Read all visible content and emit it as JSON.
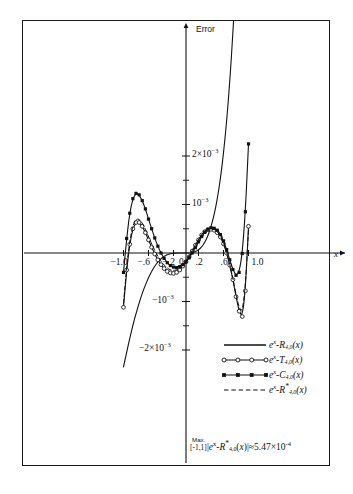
{
  "figure": {
    "axis_label_y": "Error",
    "axis_label_x": "x",
    "caption": ""
  },
  "chart_data": {
    "type": "line",
    "title": "",
    "xlabel": "x",
    "ylabel": "Error",
    "xlim": [
      -1.12,
      1.2
    ],
    "ylim": [
      -0.00235,
      0.00255
    ],
    "grid": false,
    "legend_position": "bottom-right",
    "xticks": [
      -1.0,
      -0.6,
      -0.2,
      0,
      0.2,
      0.6,
      1.0
    ],
    "xtick_labels": [
      "-1.0",
      "-.6",
      "-.2",
      "0",
      ".2",
      ".6",
      "1.0"
    ],
    "yticks": [
      -0.002,
      -0.001,
      0.001,
      0.002
    ],
    "ytick_labels": [
      "-2×10⁻³",
      "-10⁻³",
      "10⁻³",
      "2×10⁻³"
    ],
    "yminor_ticks": [
      -0.0015,
      -0.0005,
      0.0005,
      0.0015
    ],
    "annotation": {
      "prefix": "Max.",
      "interval": "[-1,1]",
      "expression": "|e",
      "full": "Max. [-1,1] |eˣ−R*₄,₀(x)| ≈ 5.47×10⁻⁴",
      "value": "5.47×10⁻⁴"
    },
    "series": [
      {
        "name": "e^x - R_{4,0}(x)",
        "label_base": "e",
        "label_sup": "x",
        "label_rest": "-R",
        "label_sub": "4,0",
        "label_tail": "(x)",
        "style": "solid",
        "marker": "none",
        "color": "#111111",
        "x": [
          -1.0,
          -0.95,
          -0.9,
          -0.85,
          -0.8,
          -0.75,
          -0.7,
          -0.65,
          -0.6,
          -0.55,
          -0.5,
          -0.45,
          -0.4,
          -0.35,
          -0.3,
          -0.25,
          -0.2,
          -0.15,
          -0.1,
          -0.05,
          0,
          0.05,
          0.1,
          0.15,
          0.2,
          0.25,
          0.3,
          0.35,
          0.4,
          0.45,
          0.5,
          0.55,
          0.6,
          0.65,
          0.7,
          0.75,
          0.8,
          0.85
        ],
        "y": [
          -0.00235,
          -0.00205,
          -0.00176,
          -0.00149,
          -0.00125,
          -0.00103,
          -0.00083,
          -0.00066,
          -0.00051,
          -0.00038,
          -0.00027,
          -0.000185,
          -0.000118,
          -6.95e-05,
          -3.65e-05,
          -1.55e-05,
          -4.8e-06,
          -8e-07,
          0,
          2e-07,
          0,
          1.2e-06,
          8.2e-06,
          2.65e-05,
          6.25e-05,
          0.000123,
          0.000216,
          0.00035,
          0.000536,
          0.000785,
          0.00111,
          0.00152,
          0.00205,
          0.00271,
          0.00352,
          0.00452,
          0.00572,
          0.00718
        ]
      },
      {
        "name": "e^x - T_{4,0}(x)",
        "label_base": "e",
        "label_sup": "x",
        "label_rest": "-T",
        "label_sub": "4,0",
        "label_tail": "(x)",
        "style": "solid",
        "marker": "open-circle",
        "color": "#111111",
        "x": [
          -1.0,
          -0.95,
          -0.9,
          -0.85,
          -0.8,
          -0.75,
          -0.7,
          -0.65,
          -0.6,
          -0.55,
          -0.5,
          -0.45,
          -0.4,
          -0.35,
          -0.3,
          -0.25,
          -0.2,
          -0.15,
          -0.1,
          -0.05,
          0,
          0.05,
          0.1,
          0.15,
          0.2,
          0.25,
          0.3,
          0.35,
          0.4,
          0.45,
          0.5,
          0.55,
          0.6,
          0.65,
          0.7,
          0.75,
          0.8,
          0.85,
          0.9,
          0.95,
          1.0
        ],
        "y": [
          -0.00112,
          -0.00035,
          0.00018,
          0.0005,
          0.00063,
          0.00063,
          0.00055,
          0.00042,
          0.00027,
          0.00012,
          -2e-05,
          -0.00014,
          -0.00024,
          -0.00032,
          -0.00038,
          -0.00041,
          -0.00042,
          -0.0004,
          -0.00035,
          -0.00027,
          -0.00018,
          -8e-05,
          4e-05,
          0.00016,
          0.00027,
          0.00037,
          0.00044,
          0.00048,
          0.00049,
          0.00047,
          0.00042,
          0.00033,
          0.00019,
          0.0,
          -0.00025,
          -0.00055,
          -0.0009,
          -0.0012,
          -0.00131,
          -0.00078,
          0.00055
        ]
      },
      {
        "name": "e^x - C_{4,0}(x)",
        "label_base": "e",
        "label_sup": "x",
        "label_rest": "-C",
        "label_sub": "4,0",
        "label_tail": "(x)",
        "style": "solid",
        "marker": "filled-square",
        "color": "#111111",
        "x": [
          -1.0,
          -0.95,
          -0.9,
          -0.85,
          -0.8,
          -0.75,
          -0.7,
          -0.65,
          -0.6,
          -0.55,
          -0.5,
          -0.45,
          -0.4,
          -0.35,
          -0.3,
          -0.25,
          -0.2,
          -0.15,
          -0.1,
          -0.05,
          0,
          0.05,
          0.1,
          0.15,
          0.2,
          0.25,
          0.3,
          0.35,
          0.4,
          0.45,
          0.5,
          0.55,
          0.6,
          0.65,
          0.7,
          0.75,
          0.8,
          0.85,
          0.9,
          0.95,
          1.0
        ],
        "y": [
          -0.0004,
          0.0003,
          0.00082,
          0.00112,
          0.00123,
          0.0012,
          0.00108,
          0.00091,
          0.0007,
          0.0005,
          0.00031,
          0.00014,
          0.0,
          -0.00011,
          -0.0002,
          -0.00026,
          -0.00029,
          -0.0003,
          -0.00028,
          -0.00024,
          -0.00018,
          -0.0001,
          0.0,
          0.00011,
          0.00023,
          0.00034,
          0.00043,
          0.00049,
          0.00052,
          0.00051,
          0.00047,
          0.00038,
          0.00025,
          7e-05,
          -0.00014,
          -0.00034,
          -0.00046,
          -0.0004,
          -1e-05,
          0.00085,
          0.00225
        ]
      },
      {
        "name": "e^x - R*_{4,0}(x)",
        "label_base": "e",
        "label_sup": "x",
        "label_rest": "-R",
        "label_sub": "4,0",
        "label_star": "*",
        "label_tail": "(x)",
        "style": "dashed",
        "marker": "none",
        "color": "#111111",
        "x": [
          -1.0,
          -0.95,
          -0.9,
          -0.85,
          -0.8,
          -0.75,
          -0.7,
          -0.65,
          -0.6,
          -0.55,
          -0.5,
          -0.45,
          -0.4,
          -0.35,
          -0.3,
          -0.25,
          -0.2,
          -0.15,
          -0.1,
          -0.05,
          0,
          0.05,
          0.1,
          0.15,
          0.2,
          0.25,
          0.3,
          0.35,
          0.4,
          0.45,
          0.5,
          0.55,
          0.6,
          0.65,
          0.7,
          0.75,
          0.8,
          0.85,
          0.9,
          0.95,
          1.0
        ],
        "y": [
          -0.00104,
          -0.00028,
          0.00025,
          0.00057,
          0.0007,
          0.0007,
          0.00062,
          0.00049,
          0.00034,
          0.00019,
          5e-05,
          -7e-05,
          -0.00017,
          -0.00025,
          -0.00031,
          -0.00035,
          -0.00036,
          -0.00035,
          -0.00031,
          -0.00024,
          -0.00016,
          -6e-05,
          5e-05,
          0.00017,
          0.00028,
          0.00038,
          0.00045,
          0.0005,
          0.00051,
          0.00049,
          0.00044,
          0.00035,
          0.00021,
          2e-05,
          -0.00023,
          -0.00052,
          -0.00085,
          -0.00113,
          -0.00122,
          -0.00068,
          0.00048
        ]
      }
    ]
  },
  "legend": {
    "entries": [
      {
        "key": "solid-line",
        "text": "eˣ-R₄,₀(x)"
      },
      {
        "key": "circle-line",
        "text": "eˣ-T₄,₀(x)"
      },
      {
        "key": "square-line",
        "text": "eˣ-C₄,₀(x)"
      },
      {
        "key": "dashed-line",
        "text": "eˣ-R*₄,₀(x)"
      }
    ]
  }
}
